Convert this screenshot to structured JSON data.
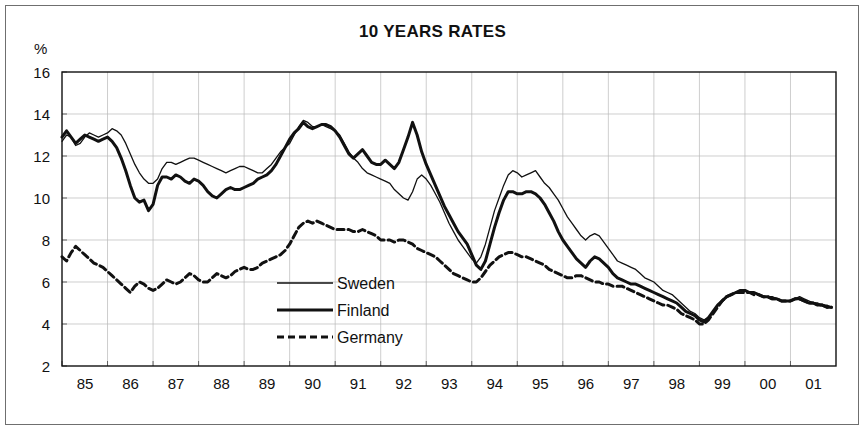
{
  "figure": {
    "title": "10 YEARS RATES",
    "y_unit": "%"
  },
  "chart_data": {
    "type": "line",
    "title": "10 YEARS RATES",
    "xlabel": "",
    "ylabel": "%",
    "ylim": [
      2,
      16
    ],
    "xlim": [
      1985.0,
      2002.0
    ],
    "y_ticks": [
      2,
      4,
      6,
      8,
      10,
      12,
      14,
      16
    ],
    "x_ticks": [
      1985,
      1986,
      1987,
      1988,
      1989,
      1990,
      1991,
      1992,
      1993,
      1994,
      1995,
      1996,
      1997,
      1998,
      1999,
      2000,
      2001
    ],
    "x_tick_labels": [
      "85",
      "86",
      "87",
      "88",
      "89",
      "90",
      "91",
      "92",
      "93",
      "94",
      "95",
      "96",
      "97",
      "98",
      "99",
      "00",
      "01"
    ],
    "grid": true,
    "grid_axes": "both",
    "legend_position": "center-bottom-left",
    "line_colors": [
      "#111111",
      "#111111",
      "#111111"
    ],
    "series": [
      {
        "name": "Sweden",
        "style": "thin-solid",
        "stroke_width": 1.3,
        "dash": "none",
        "x": [
          1985.0,
          1985.1,
          1985.2,
          1985.3,
          1985.4,
          1985.5,
          1985.6,
          1985.7,
          1985.8,
          1985.9,
          1986.0,
          1986.1,
          1986.2,
          1986.3,
          1986.4,
          1986.5,
          1986.6,
          1986.7,
          1986.8,
          1986.9,
          1987.0,
          1987.1,
          1987.2,
          1987.3,
          1987.4,
          1987.5,
          1987.6,
          1987.7,
          1987.8,
          1987.9,
          1988.0,
          1988.1,
          1988.2,
          1988.3,
          1988.4,
          1988.5,
          1988.6,
          1988.7,
          1988.8,
          1988.9,
          1989.0,
          1989.1,
          1989.2,
          1989.3,
          1989.4,
          1989.5,
          1989.6,
          1989.7,
          1989.8,
          1989.9,
          1990.0,
          1990.1,
          1990.2,
          1990.3,
          1990.4,
          1990.5,
          1990.6,
          1990.7,
          1990.8,
          1990.9,
          1991.0,
          1991.1,
          1991.2,
          1991.3,
          1991.4,
          1991.5,
          1991.6,
          1991.7,
          1991.8,
          1991.9,
          1992.0,
          1992.1,
          1992.2,
          1992.3,
          1992.4,
          1992.5,
          1992.6,
          1992.7,
          1992.8,
          1992.9,
          1993.0,
          1993.1,
          1993.2,
          1993.3,
          1993.4,
          1993.5,
          1993.6,
          1993.7,
          1993.8,
          1993.9,
          1994.0,
          1994.1,
          1994.2,
          1994.3,
          1994.4,
          1994.5,
          1994.6,
          1994.7,
          1994.8,
          1994.9,
          1995.0,
          1995.1,
          1995.2,
          1995.3,
          1995.4,
          1995.5,
          1995.6,
          1995.7,
          1995.8,
          1995.9,
          1996.0,
          1996.1,
          1996.2,
          1996.3,
          1996.4,
          1996.5,
          1996.6,
          1996.7,
          1996.8,
          1996.9,
          1997.0,
          1997.1,
          1997.2,
          1997.3,
          1997.4,
          1997.5,
          1997.6,
          1997.7,
          1997.8,
          1997.9,
          1998.0,
          1998.1,
          1998.2,
          1998.3,
          1998.4,
          1998.5,
          1998.6,
          1998.7,
          1998.8,
          1998.9,
          1999.0,
          1999.1,
          1999.2,
          1999.3,
          1999.4,
          1999.5,
          1999.6,
          1999.7,
          1999.8,
          1999.9,
          2000.0,
          2000.1,
          2000.2,
          2000.3,
          2000.4,
          2000.5,
          2000.6,
          2000.7,
          2000.8,
          2000.9,
          2001.0,
          2001.1,
          2001.2,
          2001.3,
          2001.4,
          2001.5,
          2001.6,
          2001.7,
          2001.8,
          2001.9
        ],
        "y": [
          12.7,
          13.0,
          12.9,
          12.5,
          12.6,
          12.9,
          13.1,
          13.0,
          12.9,
          13.0,
          13.1,
          13.3,
          13.2,
          13.0,
          12.6,
          12.1,
          11.6,
          11.2,
          10.9,
          10.7,
          10.7,
          10.9,
          11.4,
          11.7,
          11.7,
          11.6,
          11.7,
          11.8,
          11.9,
          11.9,
          11.8,
          11.7,
          11.6,
          11.5,
          11.4,
          11.3,
          11.2,
          11.3,
          11.4,
          11.5,
          11.5,
          11.4,
          11.3,
          11.2,
          11.2,
          11.4,
          11.6,
          11.9,
          12.2,
          12.4,
          12.6,
          13.0,
          13.4,
          13.7,
          13.6,
          13.4,
          13.4,
          13.5,
          13.4,
          13.3,
          13.2,
          13.0,
          12.6,
          12.2,
          11.9,
          11.7,
          11.4,
          11.2,
          11.1,
          11.0,
          10.9,
          10.8,
          10.7,
          10.4,
          10.2,
          10.0,
          9.9,
          10.3,
          10.9,
          11.1,
          10.9,
          10.6,
          10.2,
          9.8,
          9.3,
          8.8,
          8.4,
          8.0,
          7.7,
          7.4,
          7.1,
          6.9,
          7.2,
          7.8,
          8.6,
          9.4,
          10.0,
          10.6,
          11.1,
          11.3,
          11.2,
          11.0,
          11.1,
          11.2,
          11.3,
          11.0,
          10.7,
          10.5,
          10.2,
          9.9,
          9.5,
          9.1,
          8.8,
          8.5,
          8.2,
          8.0,
          8.2,
          8.3,
          8.2,
          7.9,
          7.6,
          7.3,
          7.0,
          6.9,
          6.8,
          6.7,
          6.6,
          6.4,
          6.2,
          6.1,
          6.0,
          5.8,
          5.6,
          5.5,
          5.4,
          5.2,
          5.0,
          4.8,
          4.6,
          4.5,
          4.3,
          4.2,
          4.3,
          4.6,
          4.9,
          5.1,
          5.3,
          5.4,
          5.5,
          5.6,
          5.6,
          5.5,
          5.5,
          5.4,
          5.3,
          5.3,
          5.3,
          5.2,
          5.1,
          5.1,
          5.1,
          5.2,
          5.3,
          5.2,
          5.1,
          5.0,
          5.0,
          4.9,
          4.9,
          4.8
        ]
      },
      {
        "name": "Finland",
        "style": "thick-solid",
        "stroke_width": 3.0,
        "dash": "none",
        "x": [
          1985.0,
          1985.1,
          1985.2,
          1985.3,
          1985.4,
          1985.5,
          1985.6,
          1985.7,
          1985.8,
          1985.9,
          1986.0,
          1986.1,
          1986.2,
          1986.3,
          1986.4,
          1986.5,
          1986.6,
          1986.7,
          1986.8,
          1986.9,
          1987.0,
          1987.1,
          1987.2,
          1987.3,
          1987.4,
          1987.5,
          1987.6,
          1987.7,
          1987.8,
          1987.9,
          1988.0,
          1988.1,
          1988.2,
          1988.3,
          1988.4,
          1988.5,
          1988.6,
          1988.7,
          1988.8,
          1988.9,
          1989.0,
          1989.1,
          1989.2,
          1989.3,
          1989.4,
          1989.5,
          1989.6,
          1989.7,
          1989.8,
          1989.9,
          1990.0,
          1990.1,
          1990.2,
          1990.3,
          1990.4,
          1990.5,
          1990.6,
          1990.7,
          1990.8,
          1990.9,
          1991.0,
          1991.1,
          1991.2,
          1991.3,
          1991.4,
          1991.5,
          1991.6,
          1991.7,
          1991.8,
          1991.9,
          1992.0,
          1992.1,
          1992.2,
          1992.3,
          1992.4,
          1992.5,
          1992.6,
          1992.7,
          1992.8,
          1992.9,
          1993.0,
          1993.1,
          1993.2,
          1993.3,
          1993.4,
          1993.5,
          1993.6,
          1993.7,
          1993.8,
          1993.9,
          1994.0,
          1994.1,
          1994.2,
          1994.3,
          1994.4,
          1994.5,
          1994.6,
          1994.7,
          1994.8,
          1994.9,
          1995.0,
          1995.1,
          1995.2,
          1995.3,
          1995.4,
          1995.5,
          1995.6,
          1995.7,
          1995.8,
          1995.9,
          1996.0,
          1996.1,
          1996.2,
          1996.3,
          1996.4,
          1996.5,
          1996.6,
          1996.7,
          1996.8,
          1996.9,
          1997.0,
          1997.1,
          1997.2,
          1997.3,
          1997.4,
          1997.5,
          1997.6,
          1997.7,
          1997.8,
          1997.9,
          1998.0,
          1998.1,
          1998.2,
          1998.3,
          1998.4,
          1998.5,
          1998.6,
          1998.7,
          1998.8,
          1998.9,
          1999.0,
          1999.1,
          1999.2,
          1999.3,
          1999.4,
          1999.5,
          1999.6,
          1999.7,
          1999.8,
          1999.9,
          2000.0,
          2000.1,
          2000.2,
          2000.3,
          2000.4,
          2000.5,
          2000.6,
          2000.7,
          2000.8,
          2000.9,
          2001.0,
          2001.1,
          2001.2,
          2001.3,
          2001.4,
          2001.5,
          2001.6,
          2001.7,
          2001.8,
          2001.9
        ],
        "y": [
          12.9,
          13.2,
          12.9,
          12.6,
          12.8,
          13.0,
          12.9,
          12.8,
          12.7,
          12.8,
          12.9,
          12.7,
          12.4,
          11.9,
          11.3,
          10.6,
          10.0,
          9.8,
          9.9,
          9.4,
          9.7,
          10.6,
          11.0,
          11.0,
          10.9,
          11.1,
          11.0,
          10.8,
          10.7,
          10.9,
          10.8,
          10.6,
          10.3,
          10.1,
          10.0,
          10.2,
          10.4,
          10.5,
          10.4,
          10.4,
          10.5,
          10.6,
          10.7,
          10.9,
          11.0,
          11.1,
          11.3,
          11.6,
          12.0,
          12.4,
          12.8,
          13.1,
          13.3,
          13.6,
          13.4,
          13.3,
          13.4,
          13.5,
          13.5,
          13.4,
          13.2,
          12.9,
          12.5,
          12.1,
          11.9,
          12.1,
          12.3,
          12.0,
          11.7,
          11.6,
          11.6,
          11.8,
          11.6,
          11.4,
          11.7,
          12.3,
          12.9,
          13.6,
          13.0,
          12.2,
          11.6,
          11.1,
          10.6,
          10.1,
          9.6,
          9.2,
          8.8,
          8.4,
          8.1,
          7.8,
          7.3,
          6.8,
          6.6,
          7.0,
          7.8,
          8.6,
          9.3,
          9.9,
          10.3,
          10.3,
          10.2,
          10.2,
          10.3,
          10.3,
          10.2,
          10.0,
          9.7,
          9.3,
          8.9,
          8.4,
          8.0,
          7.7,
          7.4,
          7.1,
          6.9,
          6.7,
          7.0,
          7.2,
          7.1,
          6.9,
          6.7,
          6.4,
          6.2,
          6.1,
          6.0,
          5.9,
          5.9,
          5.8,
          5.7,
          5.6,
          5.5,
          5.4,
          5.3,
          5.2,
          5.1,
          5.0,
          4.8,
          4.6,
          4.5,
          4.4,
          4.2,
          4.1,
          4.3,
          4.6,
          4.9,
          5.1,
          5.3,
          5.4,
          5.5,
          5.6,
          5.6,
          5.5,
          5.5,
          5.4,
          5.3,
          5.3,
          5.2,
          5.2,
          5.1,
          5.1,
          5.1,
          5.2,
          5.2,
          5.1,
          5.0,
          5.0,
          4.9,
          4.9,
          4.8,
          4.8
        ]
      },
      {
        "name": "Germany",
        "style": "thick-dashed",
        "stroke_width": 3.0,
        "dash": "7,4",
        "x": [
          1985.0,
          1985.1,
          1985.2,
          1985.3,
          1985.4,
          1985.5,
          1985.6,
          1985.7,
          1985.8,
          1985.9,
          1986.0,
          1986.1,
          1986.2,
          1986.3,
          1986.4,
          1986.5,
          1986.6,
          1986.7,
          1986.8,
          1986.9,
          1987.0,
          1987.1,
          1987.2,
          1987.3,
          1987.4,
          1987.5,
          1987.6,
          1987.7,
          1987.8,
          1987.9,
          1988.0,
          1988.1,
          1988.2,
          1988.3,
          1988.4,
          1988.5,
          1988.6,
          1988.7,
          1988.8,
          1988.9,
          1989.0,
          1989.1,
          1989.2,
          1989.3,
          1989.4,
          1989.5,
          1989.6,
          1989.7,
          1989.8,
          1989.9,
          1990.0,
          1990.1,
          1990.2,
          1990.3,
          1990.4,
          1990.5,
          1990.6,
          1990.7,
          1990.8,
          1990.9,
          1991.0,
          1991.1,
          1991.2,
          1991.3,
          1991.4,
          1991.5,
          1991.6,
          1991.7,
          1991.8,
          1991.9,
          1992.0,
          1992.1,
          1992.2,
          1992.3,
          1992.4,
          1992.5,
          1992.6,
          1992.7,
          1992.8,
          1992.9,
          1993.0,
          1993.1,
          1993.2,
          1993.3,
          1993.4,
          1993.5,
          1993.6,
          1993.7,
          1993.8,
          1993.9,
          1994.0,
          1994.1,
          1994.2,
          1994.3,
          1994.4,
          1994.5,
          1994.6,
          1994.7,
          1994.8,
          1994.9,
          1995.0,
          1995.1,
          1995.2,
          1995.3,
          1995.4,
          1995.5,
          1995.6,
          1995.7,
          1995.8,
          1995.9,
          1996.0,
          1996.1,
          1996.2,
          1996.3,
          1996.4,
          1996.5,
          1996.6,
          1996.7,
          1996.8,
          1996.9,
          1997.0,
          1997.1,
          1997.2,
          1997.3,
          1997.4,
          1997.5,
          1997.6,
          1997.7,
          1997.8,
          1997.9,
          1998.0,
          1998.1,
          1998.2,
          1998.3,
          1998.4,
          1998.5,
          1998.6,
          1998.7,
          1998.8,
          1998.9,
          1999.0,
          1999.1,
          1999.2,
          1999.3,
          1999.4,
          1999.5,
          1999.6,
          1999.7,
          1999.8,
          1999.9,
          2000.0,
          2000.1,
          2000.2,
          2000.3,
          2000.4,
          2000.5,
          2000.6,
          2000.7,
          2000.8,
          2000.9,
          2001.0,
          2001.1,
          2001.2,
          2001.3,
          2001.4,
          2001.5,
          2001.6,
          2001.7,
          2001.8,
          2001.9
        ],
        "y": [
          7.2,
          7.0,
          7.4,
          7.7,
          7.5,
          7.3,
          7.1,
          6.9,
          6.8,
          6.7,
          6.5,
          6.3,
          6.1,
          5.9,
          5.7,
          5.5,
          5.8,
          6.0,
          5.9,
          5.7,
          5.6,
          5.7,
          5.9,
          6.1,
          6.0,
          5.9,
          6.0,
          6.2,
          6.4,
          6.3,
          6.1,
          6.0,
          6.0,
          6.2,
          6.4,
          6.3,
          6.2,
          6.3,
          6.5,
          6.6,
          6.7,
          6.6,
          6.6,
          6.7,
          6.9,
          7.0,
          7.1,
          7.2,
          7.3,
          7.5,
          7.8,
          8.2,
          8.6,
          8.8,
          8.9,
          8.8,
          8.9,
          8.8,
          8.7,
          8.6,
          8.5,
          8.5,
          8.5,
          8.5,
          8.4,
          8.4,
          8.5,
          8.4,
          8.3,
          8.2,
          8.0,
          8.0,
          8.0,
          7.9,
          8.0,
          8.0,
          7.9,
          7.8,
          7.6,
          7.5,
          7.4,
          7.3,
          7.2,
          7.0,
          6.8,
          6.6,
          6.4,
          6.3,
          6.2,
          6.1,
          6.0,
          6.0,
          6.2,
          6.5,
          6.8,
          7.0,
          7.2,
          7.3,
          7.4,
          7.4,
          7.3,
          7.2,
          7.2,
          7.1,
          7.0,
          6.9,
          6.8,
          6.6,
          6.5,
          6.4,
          6.3,
          6.2,
          6.2,
          6.3,
          6.3,
          6.2,
          6.1,
          6.0,
          6.0,
          5.9,
          5.9,
          5.8,
          5.8,
          5.8,
          5.7,
          5.6,
          5.5,
          5.4,
          5.3,
          5.2,
          5.1,
          5.0,
          4.9,
          4.9,
          4.8,
          4.7,
          4.5,
          4.4,
          4.3,
          4.2,
          4.0,
          4.0,
          4.2,
          4.5,
          4.8,
          5.1,
          5.3,
          5.4,
          5.5,
          5.5,
          5.5,
          5.5,
          5.4,
          5.4,
          5.3,
          5.3,
          5.2,
          5.2,
          5.1,
          5.1,
          5.1,
          5.2,
          5.2,
          5.1,
          5.0,
          5.0,
          4.9,
          4.9,
          4.8,
          4.8
        ]
      }
    ]
  },
  "legend": {
    "items": [
      {
        "label": "Sweden"
      },
      {
        "label": "Finland"
      },
      {
        "label": "Germany"
      }
    ]
  }
}
